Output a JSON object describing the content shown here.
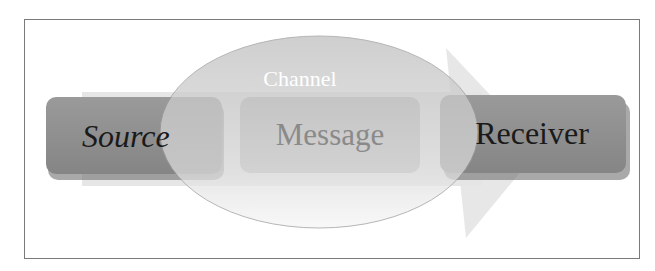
{
  "diagram": {
    "type": "communication-model",
    "nodes": {
      "source": {
        "label": "Source"
      },
      "message": {
        "label": "Message"
      },
      "receiver": {
        "label": "Receiver"
      }
    },
    "channel": {
      "label": "Channel"
    },
    "flow_direction": "left-to-right",
    "colors": {
      "box_dark": "#8e8e8e",
      "box_mid": "#b9b9b9",
      "band": "#e2e2e2",
      "ellipse": "#c8c8c8",
      "arrow": "#e4e4e4",
      "channel_text": "#ffffff",
      "text_dark": "#1a1a1a",
      "frame": "#7a7a7a"
    }
  }
}
